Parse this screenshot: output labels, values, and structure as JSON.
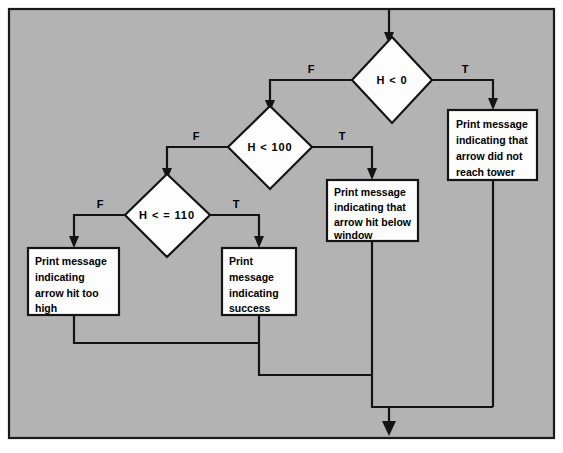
{
  "diagram": {
    "type": "flowchart",
    "background_color": "#b3b3b3",
    "node_fill_color": "#fdfdfd",
    "line_color": "#141414",
    "page_background": "#ffffff"
  },
  "nodes": {
    "decision_h_lt_0": {
      "shape": "diamond",
      "label": "H < 0"
    },
    "decision_h_lt_100": {
      "shape": "diamond",
      "label": "H < 100"
    },
    "decision_h_le_110": {
      "shape": "diamond",
      "label": "H < = 110"
    },
    "process_not_reach_tower": {
      "shape": "rectangle",
      "lines": [
        "Print message",
        "indicating that",
        "arrow did not",
        "reach tower"
      ]
    },
    "process_hit_below_window": {
      "shape": "rectangle",
      "lines": [
        "Print message",
        "indicating that",
        "arrow hit below",
        "window"
      ]
    },
    "process_hit_too_high": {
      "shape": "rectangle",
      "lines": [
        "Print message",
        "indicating",
        "arrow hit too",
        "high"
      ]
    },
    "process_success": {
      "shape": "rectangle",
      "lines": [
        "Print",
        "message",
        "indicating",
        "success"
      ]
    }
  },
  "edge_labels": {
    "h_lt_0_false": "F",
    "h_lt_0_true": "T",
    "h_lt_100_false": "F",
    "h_lt_100_true": "T",
    "h_le_110_false": "F",
    "h_le_110_true": "T"
  }
}
